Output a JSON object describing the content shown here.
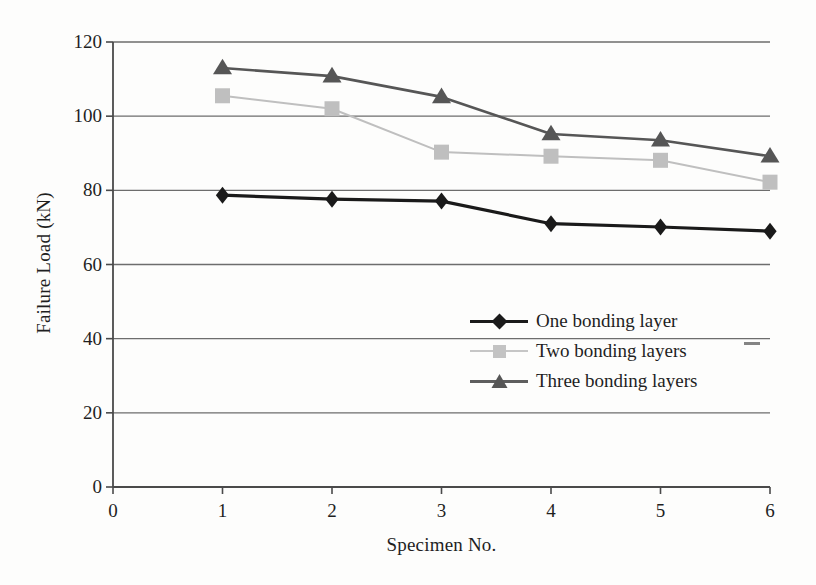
{
  "chart_data": {
    "type": "line",
    "title": "",
    "xlabel": "Specimen No.",
    "ylabel": "Failure Load (kN)",
    "x": [
      1,
      2,
      3,
      4,
      5,
      6
    ],
    "categories": [
      "1",
      "2",
      "3",
      "4",
      "5",
      "6"
    ],
    "xlim": [
      0,
      6
    ],
    "ylim": [
      0,
      120
    ],
    "xticks": [
      0,
      1,
      2,
      3,
      4,
      5,
      6
    ],
    "yticks": [
      0,
      20,
      40,
      60,
      80,
      100,
      120
    ],
    "xtick_labels": [
      "0",
      "1",
      "2",
      "3",
      "4",
      "5",
      "6"
    ],
    "ytick_labels": [
      "0",
      "20",
      "40",
      "60",
      "80",
      "100",
      "120"
    ],
    "grid": "horizontal",
    "legend_position": "center-right",
    "series": [
      {
        "name": "One bonding layer",
        "marker": "diamond",
        "color": "#1a1a1a",
        "values": [
          78.7,
          77.6,
          77.1,
          71.0,
          70.1,
          69.0
        ]
      },
      {
        "name": "Two bonding layers",
        "marker": "square",
        "color": "#bfbfbf",
        "values": [
          105.5,
          102.0,
          90.3,
          89.2,
          88.1,
          82.2
        ]
      },
      {
        "name": "Three bonding layers",
        "marker": "triangle",
        "color": "#565656",
        "values": [
          113.0,
          110.8,
          105.2,
          95.2,
          93.5,
          89.2
        ]
      }
    ]
  },
  "legend": {
    "items": [
      {
        "label": "One bonding layer"
      },
      {
        "label": "Two bonding layers"
      },
      {
        "label": "Three bonding layers"
      }
    ]
  },
  "axes": {
    "x_title": "Specimen No.",
    "y_title": "Failure Load (kN)"
  },
  "colors": {
    "series_one": "#1a1a1a",
    "series_two": "#bfbfbf",
    "series_three": "#565656",
    "axis": "#4a4a4a",
    "grid": "#6d6d6d",
    "background": "#fdfdfc"
  }
}
